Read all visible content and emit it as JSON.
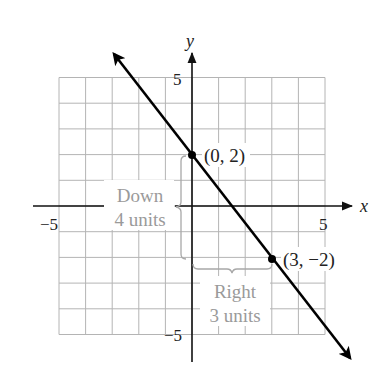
{
  "chart_data": {
    "type": "line",
    "title": "",
    "xlabel": "x",
    "ylabel": "y",
    "xlim": [
      -5,
      5
    ],
    "ylim": [
      -5,
      5
    ],
    "grid": true,
    "x_ticks": [
      -5,
      5
    ],
    "y_ticks": [
      5,
      -5
    ],
    "tick_labels": {
      "x_neg": "−5",
      "x_pos": "5",
      "y_pos": "5",
      "y_neg": "−5"
    },
    "series": [
      {
        "name": "line",
        "equation": "y = -4/3 x + 2",
        "slope": -1.3333,
        "intercept": 2,
        "direction": "arrows at both ends"
      }
    ],
    "points": [
      {
        "x": 0,
        "y": 2,
        "label": "(0, 2)"
      },
      {
        "x": 3,
        "y": -2,
        "label": "(3, −2)"
      }
    ],
    "annotations": [
      {
        "type": "vertical-brace",
        "from": [
          0,
          2
        ],
        "to": [
          0,
          -2
        ],
        "line1": "Down",
        "line2": "4 units"
      },
      {
        "type": "horizontal-brace",
        "from": [
          0,
          -2
        ],
        "to": [
          3,
          -2
        ],
        "line1": "Right",
        "line2": "3 units"
      }
    ]
  },
  "labels": {
    "x_axis": "x",
    "y_axis": "y",
    "x_tick_neg": "−5",
    "x_tick_pos": "5",
    "y_tick_pos": "5",
    "y_tick_neg": "−5",
    "point_a": "(0, 2)",
    "point_b": "(3, −2)",
    "down_line1": "Down",
    "down_line2": "4 units",
    "right_line1": "Right",
    "right_line2": "3 units"
  },
  "colors": {
    "line": "#000000",
    "grid": "#b4b4b4",
    "annotation_text": "#9a9a9a",
    "brace": "#a8a8a8"
  }
}
